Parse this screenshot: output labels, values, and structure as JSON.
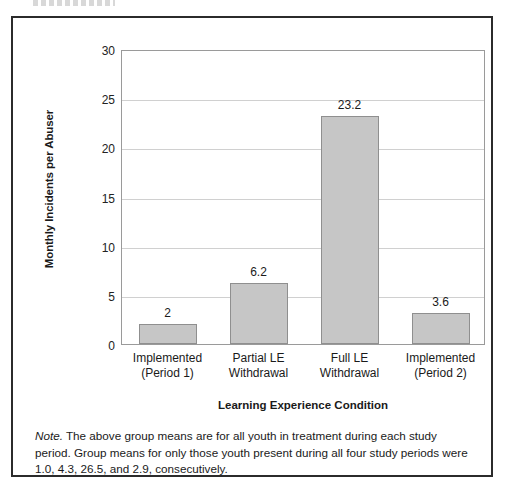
{
  "figure": {
    "note_prefix": "Note.",
    "note_body": " The above group means are for all youth in treatment during each study period. Group means for only those youth present during all four study periods were 1.0, 4.3, 26.5, and 2.9, consecutively."
  },
  "chart_data": {
    "type": "bar",
    "title": "",
    "xlabel": "Learning Experience Condition",
    "ylabel": "Monthly Incidents per Abuser",
    "categories": [
      "Implemented\n(Period 1)",
      "Partial LE\nWithdrawal",
      "Full LE\nWithdrawal",
      "Implemented\n(Period 2)"
    ],
    "category_lines": [
      [
        "Implemented",
        "(Period 1)"
      ],
      [
        "Partial LE",
        "Withdrawal"
      ],
      [
        "Full LE",
        "Withdrawal"
      ],
      [
        "Implemented",
        "(Period 2)"
      ]
    ],
    "values": [
      2,
      6.2,
      23.2,
      3.6
    ],
    "value_labels": [
      "2",
      "6.2",
      "23.2",
      "3.6"
    ],
    "bar_heights": [
      2.0,
      6.2,
      23.2,
      3.2
    ],
    "ylim": [
      0,
      30
    ],
    "yticks": [
      0,
      5,
      10,
      15,
      20,
      25,
      30
    ],
    "ytick_labels": [
      "0",
      "5",
      "10",
      "15",
      "20",
      "25",
      "30"
    ],
    "grid": true,
    "grid_axis": "y",
    "legend": false,
    "bar_color": "#c6c6c6",
    "bar_edge_color": "#8f8f8f",
    "grid_color": "#d0d0d0",
    "axis_color": "#9a9a9a"
  }
}
